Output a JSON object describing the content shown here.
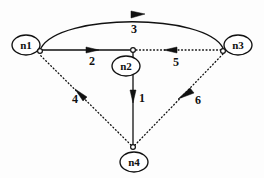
{
  "diagram": {
    "type": "directed-graph",
    "width": 264,
    "height": 178,
    "background_color": "#fdfdfd",
    "stroke_color": "#111111",
    "nodes": [
      {
        "id": "n1",
        "label": "n1",
        "cx": 26,
        "cy": 45,
        "rx": 14,
        "ry": 10,
        "port_x": 40,
        "port_y": 51
      },
      {
        "id": "n2",
        "label": "n2",
        "cx": 126,
        "cy": 66,
        "rx": 14,
        "ry": 10,
        "port_x": 133,
        "port_y": 50
      },
      {
        "id": "n3",
        "label": "n3",
        "cx": 238,
        "cy": 45,
        "rx": 14,
        "ry": 10,
        "port_x": 223,
        "port_y": 51
      },
      {
        "id": "n4",
        "label": "n4",
        "cx": 134,
        "cy": 162,
        "rx": 14,
        "ry": 10,
        "port_x": 133,
        "port_y": 147
      }
    ],
    "edges": [
      {
        "id": "e1",
        "label": "1",
        "from": "n2",
        "to": "n4",
        "style": "solid",
        "label_x": 142,
        "label_y": 99,
        "arrow_dir": "down"
      },
      {
        "id": "e2",
        "label": "2",
        "from": "n1",
        "to": "n2",
        "style": "solid",
        "label_x": 92,
        "label_y": 62,
        "arrow_dir": "right"
      },
      {
        "id": "e3",
        "label": "3",
        "from": "n1",
        "to": "n3",
        "style": "solid",
        "label_x": 134,
        "label_y": 30,
        "arrow_dir": "right",
        "curved": true
      },
      {
        "id": "e4",
        "label": "4",
        "from": "n4",
        "to": "n1",
        "style": "dotted",
        "label_x": 75,
        "label_y": 100,
        "arrow_dir": "up-left"
      },
      {
        "id": "e5",
        "label": "5",
        "from": "n3",
        "to": "n2",
        "style": "dotted",
        "label_x": 176,
        "label_y": 63,
        "arrow_dir": "left"
      },
      {
        "id": "e6",
        "label": "6",
        "from": "n3",
        "to": "n4",
        "style": "dotted",
        "label_x": 198,
        "label_y": 101,
        "arrow_dir": "down-left"
      }
    ]
  }
}
